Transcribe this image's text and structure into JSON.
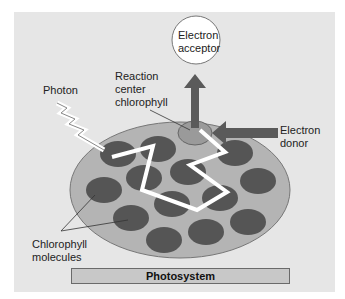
{
  "diagram": {
    "title": "Photosystem",
    "labels": {
      "electron_acceptor_line1": "Electron",
      "electron_acceptor_line2": "acceptor",
      "reaction_center_line1": "Reaction",
      "reaction_center_line2": "center",
      "reaction_center_line3": "chlorophyll",
      "photon": "Photon",
      "electron_donor_line1": "Electron",
      "electron_donor_line2": "donor",
      "chlorophyll_line1": "Chlorophyll",
      "chlorophyll_line2": "molecules",
      "photosystem": "Photosystem"
    },
    "colors": {
      "panel_bg": "#e6e6e6",
      "disc_fill": "#b4b4b4",
      "chlorophyll_fill": "#555555",
      "reaction_center_fill": "#9a9a9a",
      "arrow_fill": "#5a5a5a",
      "path_color": "#ffffff"
    }
  }
}
